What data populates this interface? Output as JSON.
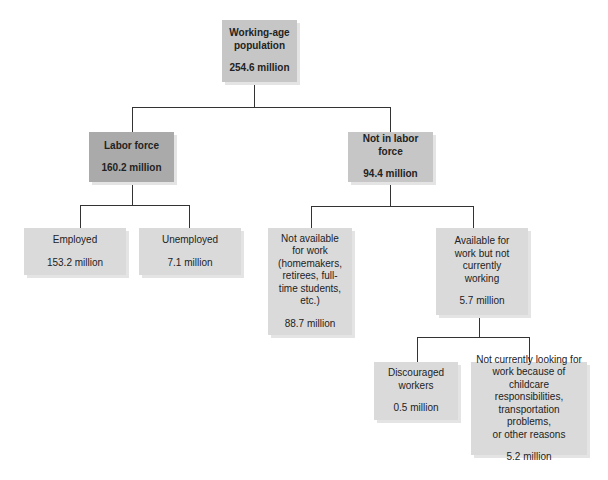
{
  "diagram": {
    "nodes": {
      "working_age": {
        "label": "Working-age\npopulation",
        "value": "254.6 million"
      },
      "labor_force": {
        "label": "Labor force",
        "value": "160.2 million"
      },
      "not_in_labor_force": {
        "label": "Not in labor force",
        "value": "94.4 million"
      },
      "employed": {
        "label": "Employed",
        "value": "153.2 million"
      },
      "unemployed": {
        "label": "Unemployed",
        "value": "7.1 million"
      },
      "not_available": {
        "label": "Not available\nfor work\n(homemakers,\nretirees, full-\ntime students,\netc.)",
        "value": "88.7 million"
      },
      "available_not_working": {
        "label": "Available for\nwork but not\ncurrently\nworking",
        "value": "5.7 million"
      },
      "discouraged": {
        "label": "Discouraged\nworkers",
        "value": "0.5 million"
      },
      "not_looking_other": {
        "label": "Not currently looking for\nwork because of\nchildcare responsibilities,\ntransportation problems,\nor other reasons",
        "value": "5.2 million"
      }
    },
    "edges": [
      [
        "working_age",
        "labor_force"
      ],
      [
        "working_age",
        "not_in_labor_force"
      ],
      [
        "labor_force",
        "employed"
      ],
      [
        "labor_force",
        "unemployed"
      ],
      [
        "not_in_labor_force",
        "not_available"
      ],
      [
        "not_in_labor_force",
        "available_not_working"
      ],
      [
        "available_not_working",
        "discouraged"
      ],
      [
        "available_not_working",
        "not_looking_other"
      ]
    ],
    "colors": {
      "level1": "#c6c6c6",
      "labor_force": "#aaaaaa",
      "lower": "#dadada",
      "line": "#333333"
    }
  }
}
